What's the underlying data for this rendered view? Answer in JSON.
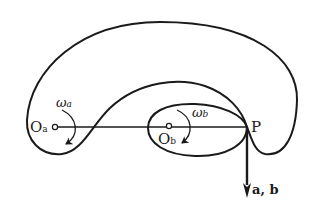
{
  "diagram": {
    "type": "kinematics-figure",
    "colors": {
      "stroke": "#1a1a1a",
      "background": "#ffffff"
    },
    "points": {
      "Oa": {
        "label": "O",
        "subscript": "a"
      },
      "Ob": {
        "label": "O",
        "subscript": "b"
      },
      "P": {
        "label": "P"
      }
    },
    "angular_velocities": {
      "a": {
        "symbol": "ω",
        "subscript": "a"
      },
      "b": {
        "symbol": "ω",
        "subscript": "b"
      }
    },
    "vector_label": "a, b"
  }
}
